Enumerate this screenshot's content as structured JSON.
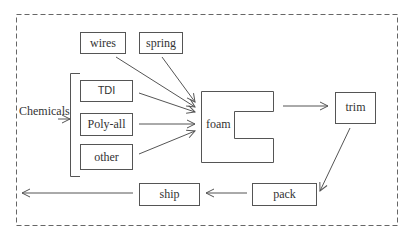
{
  "diagram": {
    "type": "process-flow",
    "inputs": {
      "top": [
        {
          "id": "wires",
          "label": "wires"
        },
        {
          "id": "spring",
          "label": "spring"
        }
      ],
      "chemicals_group": {
        "label": "Chemicals",
        "items": [
          {
            "id": "tdi",
            "label": "TDI"
          },
          {
            "id": "polyall",
            "label": "Poly-all"
          },
          {
            "id": "other",
            "label": "other"
          }
        ]
      }
    },
    "nodes": {
      "foam": "foam",
      "trim": "trim",
      "pack": "pack",
      "ship": "ship"
    },
    "edges": [
      [
        "wires",
        "foam"
      ],
      [
        "spring",
        "foam"
      ],
      [
        "TDI",
        "foam"
      ],
      [
        "Poly-all",
        "foam"
      ],
      [
        "other",
        "foam"
      ],
      [
        "foam",
        "trim"
      ],
      [
        "trim",
        "pack"
      ],
      [
        "pack",
        "ship"
      ],
      [
        "ship",
        "out"
      ]
    ],
    "colors": {
      "stroke": "#555555",
      "text": "#333333",
      "background": "#ffffff"
    }
  }
}
